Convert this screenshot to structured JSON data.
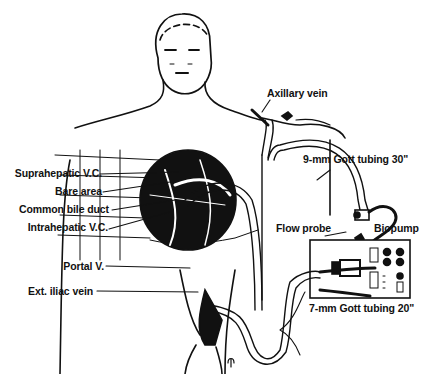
{
  "figure": {
    "type": "anatomical-schematic",
    "colors": {
      "ink": "#111111",
      "background": "#ffffff"
    }
  },
  "labels": {
    "axillary_vein": "Axillary vein",
    "gott_9mm": "9-mm Gott tubing 30\"",
    "suprahepatic_vc": "Suprahepatic V.C.",
    "bare_area": "Bare area",
    "common_bile_duct": "Common bile duct",
    "intrahepatic_vc": "Intrahepatic V.C.",
    "flow_probe": "Flow probe",
    "biopump": "Biopump",
    "portal_v": "Portal V.",
    "ext_iliac_vein": "Ext. iliac vein",
    "gott_7mm": "7-mm Gott tubing 20\""
  }
}
